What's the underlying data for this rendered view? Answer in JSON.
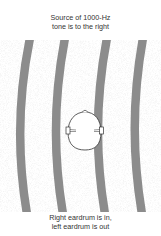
{
  "top_caption": {
    "line1": "Source of 1000-Hz",
    "line2": "tone is to the right"
  },
  "bottom_caption": {
    "line1": "Right eardrum is in,",
    "line2": "left eardrum is out"
  },
  "figure": {
    "wave_band_color": "#8c8c8c",
    "stipple_color": "#d8d8d8",
    "wave_band_count": 4
  }
}
